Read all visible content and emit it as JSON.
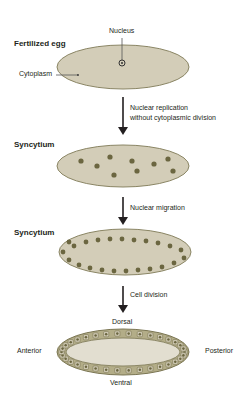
{
  "stages": [
    {
      "title": "Fertilized egg",
      "labels": {
        "nucleus": "Nucleus",
        "cytoplasm": "Cytoplasm"
      }
    },
    {
      "title": "Syncytium"
    },
    {
      "title": "Syncytium"
    },
    {
      "title": "",
      "axes": {
        "dorsal": "Dorsal",
        "ventral": "Ventral",
        "anterior": "Anterior",
        "posterior": "Posterior"
      }
    }
  ],
  "steps": [
    {
      "lines": [
        "Nuclear replication",
        "without cytoplasmic division"
      ]
    },
    {
      "lines": [
        "Nuclear migration"
      ]
    },
    {
      "lines": [
        "Cell division"
      ]
    }
  ],
  "colors": {
    "egg_fill": "#d3cdb8",
    "egg_stroke": "#8a8564",
    "nucleus": "#6b6640",
    "arrow": "#231f20",
    "cell_band": "#b3ad88",
    "blastoderm_inner": "#e2ded0"
  }
}
